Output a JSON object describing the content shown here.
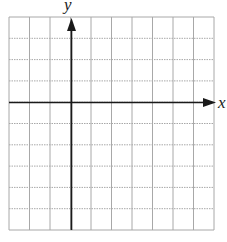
{
  "figure": {
    "type": "coordinate-plane",
    "grid": {
      "columns": 10,
      "rows": 10,
      "line_color": "#a8a8a8"
    },
    "axes": {
      "color": "#1a1a1a",
      "x_label": "x",
      "y_label": "y",
      "origin_cell": {
        "col": 3,
        "row": 4
      }
    }
  }
}
